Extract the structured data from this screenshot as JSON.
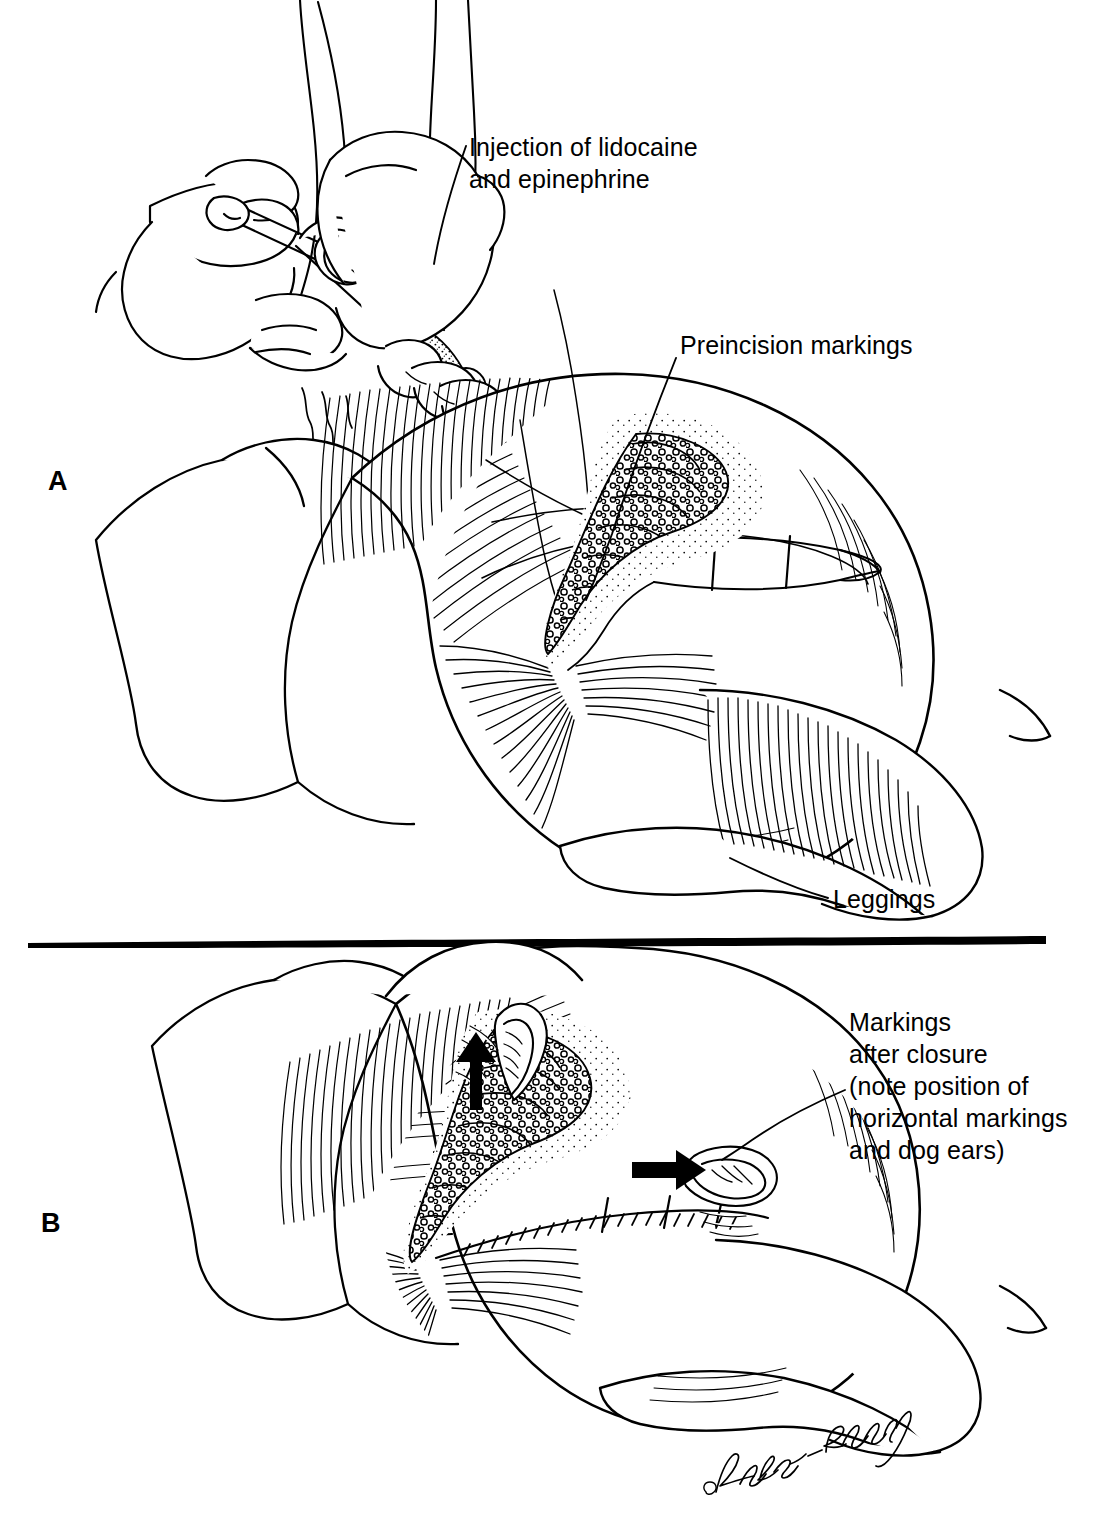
{
  "figure": {
    "type": "medical-line-art-illustration",
    "artist_signature": "Lykes-Sperling",
    "background_color": "#ffffff",
    "ink_color": "#000000"
  },
  "panels": [
    {
      "letter": "A",
      "description": "Gloved hands injecting local anesthetic into skin of buttock/thigh draped with leggings; preincision elliptical markings drawn around a stippled lesion.",
      "labels": [
        {
          "name": "injection-label",
          "lines": [
            "Injection of lidocaine",
            "and epinephrine"
          ],
          "text": "Injection of lidocaine\nand epinephrine"
        },
        {
          "name": "preincision-label",
          "lines": [
            "Preincision markings"
          ],
          "text": "Preincision markings"
        },
        {
          "name": "leggings-label",
          "lines": [
            "Leggings"
          ],
          "text": "Leggings"
        }
      ]
    },
    {
      "letter": "B",
      "description": "Same region after closure; linear suture line with horizontal cross markings and two dog ears indicated by solid black arrows (one pointing up, one pointing right).",
      "labels": [
        {
          "name": "markings-after-closure-label",
          "lines": [
            "Markings",
            "after closure",
            "(note position of",
            "horizontal markings",
            "and dog ears)"
          ],
          "text": "Markings\nafter closure\n(note position of\nhorizontal markings\nand dog ears)"
        }
      ],
      "arrows": [
        {
          "name": "dog-ear-arrow-up",
          "direction": "up"
        },
        {
          "name": "dog-ear-arrow-right",
          "direction": "right"
        }
      ]
    }
  ],
  "divider": {
    "name": "panel-divider",
    "orientation": "horizontal"
  },
  "signature": {
    "name": "artist-signature",
    "text": "Lykes-Sperling"
  }
}
